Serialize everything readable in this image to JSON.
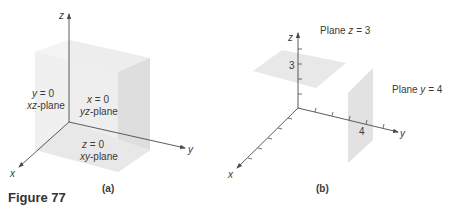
{
  "figure": {
    "caption": "Figure 77"
  },
  "panel_a": {
    "label": "(a)",
    "axes": {
      "x": "x",
      "y": "y",
      "z": "z"
    },
    "planes": [
      {
        "equation_var": "y",
        "equation_rest": " = 0",
        "name_var": "xz",
        "name_rest": "-plane"
      },
      {
        "equation_var": "x",
        "equation_rest": " = 0",
        "name_var": "yz",
        "name_rest": "-plane"
      },
      {
        "equation_var": "z",
        "equation_rest": " = 0",
        "name_var": "xy",
        "name_rest": "-plane"
      }
    ]
  },
  "panel_b": {
    "label": "(b)",
    "axes": {
      "x": "x",
      "y": "y",
      "z": "z"
    },
    "z_tick_label": "3",
    "y_tick_label": "4",
    "plane_z": {
      "prefix": "Plane ",
      "var": "z",
      "rest": " = 3"
    },
    "plane_y": {
      "prefix": "Plane ",
      "var": "y",
      "rest": " = 4"
    }
  },
  "colors": {
    "axis": "#4a4a4a",
    "plane_fill": "#e6e6e6",
    "plane_fill_dark": "#dadada",
    "plane_fill_light": "#f0f0f0",
    "text": "#3a3a3a"
  }
}
